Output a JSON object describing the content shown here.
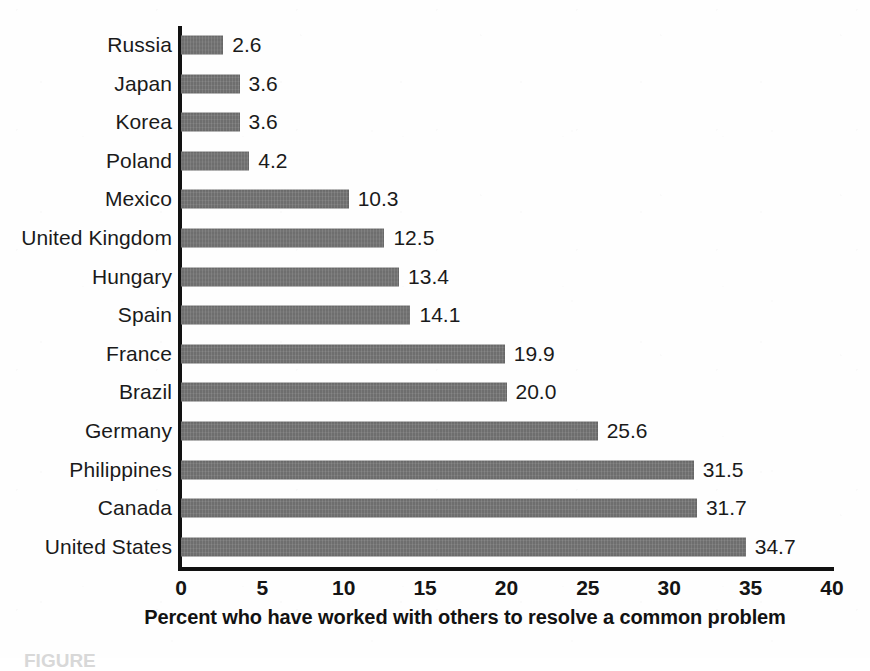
{
  "chart_data": {
    "type": "bar",
    "orientation": "horizontal",
    "title": "",
    "subtitle": "",
    "xlabel": "Percent who have worked with others to resolve a common problem",
    "ylabel": "",
    "xlim": [
      0,
      40
    ],
    "xticks": [
      "0",
      "5",
      "10",
      "15",
      "20",
      "25",
      "30",
      "35",
      "40"
    ],
    "xtick_values": [
      0,
      5,
      10,
      15,
      20,
      25,
      30,
      35,
      40
    ],
    "grid": false,
    "legend": false,
    "legend_position": "none",
    "bar_color": "#6e6e6e",
    "axis_color": "#111111",
    "text_color": "#1a1a1a",
    "categories": [
      "Russia",
      "Japan",
      "Korea",
      "Poland",
      "Mexico",
      "United Kingdom",
      "Hungary",
      "Spain",
      "France",
      "Brazil",
      "Germany",
      "Philippines",
      "Canada",
      "United States"
    ],
    "values": [
      2.6,
      3.6,
      3.6,
      4.2,
      10.3,
      12.5,
      13.4,
      14.1,
      19.9,
      20.0,
      25.6,
      31.5,
      31.7,
      34.7
    ],
    "value_labels": [
      "2.6",
      "3.6",
      "3.6",
      "4.2",
      "10.3",
      "12.5",
      "13.4",
      "14.1",
      "19.9",
      "20.0",
      "25.6",
      "31.5",
      "31.7",
      "34.7"
    ]
  },
  "caption": {
    "text": "FIGURE"
  }
}
